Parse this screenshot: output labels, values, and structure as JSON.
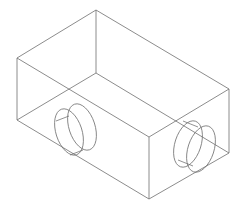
{
  "drawing": {
    "type": "isometric-wireframe",
    "subject": "rectangular block with two cylindrical bosses/holes",
    "line_color": "#6e6e6e",
    "background": "#ffffff",
    "vertices": {
      "top_back": [
        96,
        10
      ],
      "left_top": [
        17,
        58
      ],
      "right_top": [
        229,
        89
      ],
      "front_top": [
        149,
        137
      ],
      "left_bottom": [
        17,
        120
      ],
      "right_bottom": [
        229,
        153
      ],
      "front_bottom": [
        149,
        199
      ],
      "back_bottom_hidden": [
        96,
        73
      ]
    },
    "cylinders": [
      {
        "name": "left-cylinder",
        "back_center": [
          69,
          132
        ],
        "front_center": [
          82,
          127
        ],
        "rx": 13,
        "ry": 24,
        "rotate": -18
      },
      {
        "name": "right-cylinder",
        "back_center": [
          188,
          144
        ],
        "front_center": [
          201,
          149
        ],
        "rx": 13,
        "ry": 24,
        "rotate": 18
      }
    ]
  }
}
